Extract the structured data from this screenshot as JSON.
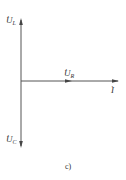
{
  "diagram": {
    "type": "phasor-diagram",
    "caption": "c)",
    "phasors": [
      {
        "id": "UL",
        "symbol": "U",
        "subscript": "L",
        "direction": "up"
      },
      {
        "id": "UR",
        "symbol": "U",
        "subscript": "R",
        "direction": "right"
      },
      {
        "id": "I",
        "symbol": "I",
        "subscript": "",
        "direction": "right"
      },
      {
        "id": "UC",
        "symbol": "U",
        "subscript": "C",
        "direction": "down"
      }
    ],
    "colors": {
      "line": "#555555",
      "text": "#333333"
    }
  }
}
